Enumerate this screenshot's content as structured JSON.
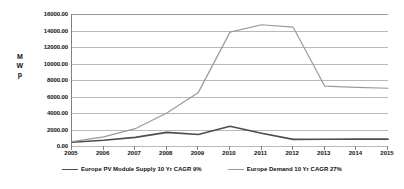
{
  "chart_data": {
    "type": "line",
    "title": "",
    "xlabel": "",
    "ylabel": "MWp",
    "ylabel_chars": [
      "M",
      "W",
      "p"
    ],
    "x": [
      2005,
      2006,
      2007,
      2008,
      2009,
      2010,
      2011,
      2012,
      2013,
      2014,
      2015
    ],
    "categories": [
      "2005",
      "2006",
      "2007",
      "2008",
      "2009",
      "2010",
      "2011",
      "2012",
      "2013",
      "2014",
      "2015"
    ],
    "ylim": [
      0,
      16000
    ],
    "yticks": [
      0,
      2000,
      4000,
      6000,
      8000,
      10000,
      12000,
      14000,
      16000
    ],
    "ytick_labels": [
      "0.00",
      "2000.00",
      "4000.00",
      "6000.00",
      "8000.00",
      "10000.00",
      "12000.00",
      "14000.00",
      "16000.00"
    ],
    "grid": true,
    "legend_position": "bottom",
    "series": [
      {
        "name": "Europe PV Module Supply 10 Yr CAGR 9%",
        "color": "#4d4d4d",
        "width": 1.6,
        "values": [
          450,
          700,
          1050,
          1650,
          1400,
          2400,
          1550,
          800,
          820,
          830,
          830
        ]
      },
      {
        "name": "Europe Demand 10 Yr CAGR 27%",
        "color": "#9a9a9a",
        "width": 1.2,
        "values": [
          520,
          1100,
          2100,
          4000,
          6500,
          13800,
          14700,
          14400,
          7250,
          7100,
          7000
        ]
      }
    ]
  }
}
